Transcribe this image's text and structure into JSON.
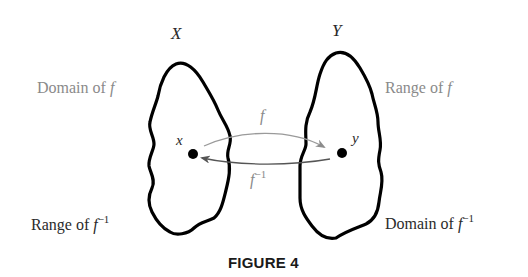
{
  "figure": {
    "caption": "FIGURE 4",
    "sets": {
      "left": {
        "name": "X",
        "point": "x"
      },
      "right": {
        "name": "Y",
        "point": "y"
      }
    },
    "labels": {
      "domain_f_prefix": "Domain of ",
      "domain_f_fn": "f",
      "range_f_prefix": "Range of ",
      "range_f_fn": "f",
      "range_finv_prefix": "Range of ",
      "range_finv_fn": "f",
      "range_finv_sup": "−1",
      "domain_finv_prefix": "Domain of ",
      "domain_finv_fn": "f",
      "domain_finv_sup": "−1"
    },
    "arrows": {
      "forward": {
        "label": "f",
        "from": "x",
        "to": "y"
      },
      "inverse": {
        "label": "f",
        "sup": "−1",
        "from": "y",
        "to": "x"
      }
    },
    "colors": {
      "outline": "#000000",
      "arrow": "#8c8c8c",
      "label_gray": "#8a8a8a",
      "text_dark": "#2a2a2a"
    }
  }
}
